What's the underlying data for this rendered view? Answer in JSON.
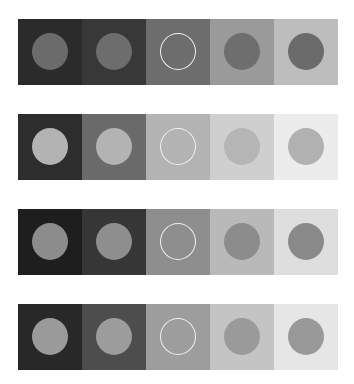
{
  "figure": {
    "rows": [
      {
        "top": 19,
        "cells": [
          {
            "bg": "#2b2b2b",
            "disk": "#6b6b6b",
            "outlined": false
          },
          {
            "bg": "#383838",
            "disk": "#6d6d6d",
            "outlined": false
          },
          {
            "bg": "#6d6d6d",
            "disk": "#6d6d6d",
            "outlined": true
          },
          {
            "bg": "#9a9a9a",
            "disk": "#6e6e6e",
            "outlined": false
          },
          {
            "bg": "#bdbdbd",
            "disk": "#6b6b6b",
            "outlined": false
          }
        ]
      },
      {
        "top": 114,
        "cells": [
          {
            "bg": "#2d2d2d",
            "disk": "#b3b3b3",
            "outlined": false
          },
          {
            "bg": "#6a6a6a",
            "disk": "#b3b3b3",
            "outlined": false
          },
          {
            "bg": "#b3b3b3",
            "disk": "#b3b3b3",
            "outlined": true
          },
          {
            "bg": "#cfcfcf",
            "disk": "#b5b5b5",
            "outlined": false
          },
          {
            "bg": "#ececec",
            "disk": "#b1b1b1",
            "outlined": false
          }
        ]
      },
      {
        "top": 209,
        "cells": [
          {
            "bg": "#1e1e1e",
            "disk": "#8c8c8c",
            "outlined": false
          },
          {
            "bg": "#363636",
            "disk": "#8e8e8e",
            "outlined": false
          },
          {
            "bg": "#8e8e8e",
            "disk": "#8e8e8e",
            "outlined": true
          },
          {
            "bg": "#b9b9b9",
            "disk": "#8c8c8c",
            "outlined": false
          },
          {
            "bg": "#dedede",
            "disk": "#8a8a8a",
            "outlined": false
          }
        ]
      },
      {
        "top": 304,
        "cells": [
          {
            "bg": "#282828",
            "disk": "#9a9a9a",
            "outlined": false
          },
          {
            "bg": "#4d4d4d",
            "disk": "#9c9c9c",
            "outlined": false
          },
          {
            "bg": "#9d9d9d",
            "disk": "#9d9d9d",
            "outlined": true
          },
          {
            "bg": "#c4c4c4",
            "disk": "#9a9a9a",
            "outlined": false
          },
          {
            "bg": "#e6e6e6",
            "disk": "#999999",
            "outlined": false
          }
        ]
      }
    ],
    "outline_color": "#f0f0f0"
  }
}
